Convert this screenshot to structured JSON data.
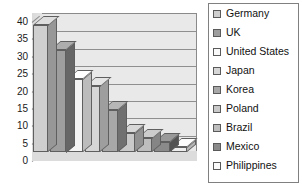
{
  "chart_data": {
    "type": "bar",
    "title": "",
    "xlabel": "",
    "ylabel": "",
    "ylim": [
      0,
      40
    ],
    "ytick_step": 5,
    "yticks": [
      "40",
      "35",
      "30",
      "25",
      "20",
      "15",
      "10",
      "5",
      "0"
    ],
    "grid": true,
    "legend_position": "right",
    "style": "3d-column",
    "categories": [
      "Germany",
      "UK",
      "United States",
      "Japan",
      "Korea",
      "Poland",
      "Brazil",
      "Mexico",
      "Philippines"
    ],
    "values": [
      36.5,
      29.5,
      21,
      19,
      12,
      5.5,
      4,
      3,
      1.5
    ],
    "bar_colors": [
      "#cfcfcf",
      "#9e9e9e",
      "#f4f4f4",
      "#d6d6d6",
      "#a8a8a8",
      "#c9c9c9",
      "#bdbdbd",
      "#8a8a8a",
      "#ededed"
    ],
    "series": [
      {
        "name": "Countries",
        "points": [
          {
            "label": "Germany",
            "value": 36.5,
            "color": "#cfcfcf"
          },
          {
            "label": "UK",
            "value": 29.5,
            "color": "#9e9e9e"
          },
          {
            "label": "United States",
            "value": 21,
            "color": "#f4f4f4"
          },
          {
            "label": "Japan",
            "value": 19,
            "color": "#d6d6d6"
          },
          {
            "label": "Korea",
            "value": 12,
            "color": "#a8a8a8"
          },
          {
            "label": "Poland",
            "value": 5.5,
            "color": "#c9c9c9"
          },
          {
            "label": "Brazil",
            "value": 4,
            "color": "#bdbdbd"
          },
          {
            "label": "Mexico",
            "value": 3,
            "color": "#8a8a8a"
          },
          {
            "label": "Philippines",
            "value": 1.5,
            "color": "#ededed"
          }
        ]
      }
    ]
  },
  "legend": {
    "items": [
      {
        "label": "Germany",
        "color": "#cfcfcf"
      },
      {
        "label": "UK",
        "color": "#9e9e9e"
      },
      {
        "label": "United States",
        "color": "#f9f9f9"
      },
      {
        "label": "Japan",
        "color": "#d6d6d6"
      },
      {
        "label": "Korea",
        "color": "#a8a8a8"
      },
      {
        "label": "Poland",
        "color": "#c9c9c9"
      },
      {
        "label": "Brazil",
        "color": "#bdbdbd"
      },
      {
        "label": "Mexico",
        "color": "#8a8a8a"
      },
      {
        "label": "Philippines",
        "color": "#fbfbfb"
      }
    ]
  },
  "colors": {
    "plot_background": "#ececec",
    "gridline": "#8f8f8f",
    "axis": "#6f6f6f",
    "legend_border": "#808080",
    "text": "#111111"
  }
}
